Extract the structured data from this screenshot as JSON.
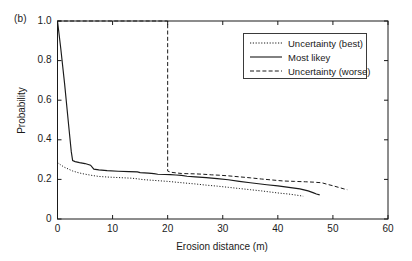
{
  "figure": {
    "panel_label": "(b)",
    "bg_color": "#ffffff",
    "line_color": "#1a1a1a"
  },
  "chart_data": {
    "type": "line",
    "title": "",
    "panel": "(b)",
    "xlabel": "Erosion distance (m)",
    "ylabel": "Probability",
    "xlim": [
      0,
      60
    ],
    "ylim": [
      0,
      1.0
    ],
    "xticks": [
      0,
      10,
      20,
      30,
      40,
      50,
      60
    ],
    "yticks": [
      0,
      0.2,
      0.4,
      0.6,
      0.8,
      1.0
    ],
    "ytick_labels": [
      "0",
      "0.2",
      "0.4",
      "0.6",
      "0.8",
      "1.0"
    ],
    "xtick_labels": [
      "0",
      "10",
      "20",
      "30",
      "40",
      "50",
      "60"
    ],
    "grid": false,
    "legend_position": "upper right",
    "series": [
      {
        "name": "Uncertainty (best)",
        "style": "dotted",
        "x": [
          0,
          0.5,
          1.2,
          2.0,
          2.7,
          3.5,
          4.5,
          5.5,
          6.5,
          7.5,
          9.0,
          10.5,
          12.0,
          13.5,
          14.5,
          15.5,
          17.0,
          18.5,
          20.0,
          21.5,
          23.0,
          25.0,
          27.0,
          29.0,
          31.0,
          33.0,
          35.0,
          37.0,
          39.0,
          40.5,
          42.0,
          43.0,
          44.0,
          44.6
        ],
        "y": [
          0.285,
          0.275,
          0.262,
          0.252,
          0.243,
          0.236,
          0.229,
          0.224,
          0.219,
          0.215,
          0.212,
          0.21,
          0.208,
          0.206,
          0.203,
          0.199,
          0.196,
          0.193,
          0.19,
          0.186,
          0.182,
          0.177,
          0.171,
          0.166,
          0.16,
          0.154,
          0.148,
          0.142,
          0.135,
          0.13,
          0.126,
          0.122,
          0.118,
          0.115
        ]
      },
      {
        "name": "Most likey",
        "style": "solid",
        "x": [
          0,
          0.6,
          1.3,
          2.0,
          2.5,
          2.75,
          3.2,
          4.0,
          5.0,
          6.0,
          6.6,
          7.5,
          9.0,
          11.0,
          13.0,
          14.5,
          15.0,
          16.5,
          17.5,
          18.2,
          19.5,
          20.5,
          21.5,
          22.5,
          23.5,
          25.0,
          27.0,
          29.0,
          31.0,
          33.0,
          35.0,
          36.5,
          38.0,
          40.0,
          42.0,
          44.0,
          45.5,
          46.5,
          47.0,
          47.6
        ],
        "y": [
          1.0,
          0.86,
          0.68,
          0.48,
          0.34,
          0.295,
          0.29,
          0.285,
          0.28,
          0.272,
          0.252,
          0.248,
          0.244,
          0.241,
          0.239,
          0.238,
          0.234,
          0.232,
          0.229,
          0.226,
          0.225,
          0.224,
          0.222,
          0.22,
          0.216,
          0.213,
          0.209,
          0.204,
          0.198,
          0.19,
          0.183,
          0.178,
          0.173,
          0.167,
          0.16,
          0.152,
          0.142,
          0.132,
          0.126,
          0.122
        ]
      },
      {
        "name": "Uncertainty (worse)",
        "style": "dashed",
        "x": [
          0,
          5,
          10,
          15,
          19.9,
          20.0,
          20.0,
          20.6,
          21.5,
          22.5,
          23.5,
          25.0,
          26.5,
          28.0,
          29.5,
          31.0,
          33.0,
          35.0,
          37.0,
          39.0,
          41.0,
          43.0,
          45.0,
          46.5,
          48.0,
          49.0,
          50.0,
          51.0,
          52.0,
          52.6
        ],
        "y": [
          1.0,
          1.0,
          1.0,
          1.0,
          1.0,
          1.0,
          0.242,
          0.236,
          0.233,
          0.23,
          0.229,
          0.228,
          0.226,
          0.223,
          0.221,
          0.218,
          0.213,
          0.208,
          0.202,
          0.197,
          0.192,
          0.19,
          0.188,
          0.186,
          0.183,
          0.175,
          0.168,
          0.16,
          0.152,
          0.148
        ]
      }
    ]
  },
  "legend": {
    "entries": [
      {
        "label": "Uncertainty (best)",
        "style": "dotted"
      },
      {
        "label": "Most likey",
        "style": "solid"
      },
      {
        "label": "Uncertainty (worse)",
        "style": "dashed"
      }
    ]
  }
}
